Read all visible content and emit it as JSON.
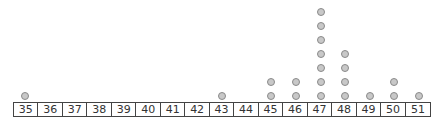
{
  "chart_data": {
    "type": "dot_plot",
    "title": "",
    "xlabel": "",
    "ylabel": "",
    "categories": [
      35,
      36,
      37,
      38,
      39,
      40,
      41,
      42,
      43,
      44,
      45,
      46,
      47,
      48,
      49,
      50,
      51
    ],
    "values": [
      1,
      0,
      0,
      0,
      0,
      0,
      0,
      0,
      1,
      0,
      2,
      2,
      7,
      4,
      1,
      2,
      1
    ],
    "xlim": [
      35,
      51
    ],
    "grid": false,
    "legend": null
  },
  "colors": {
    "dot_fill": "#c8c8c8",
    "dot_stroke": "#8a8a8a",
    "axis": "#444444"
  }
}
